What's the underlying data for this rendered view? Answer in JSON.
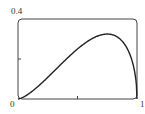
{
  "chart_data": {
    "type": "line",
    "title": "",
    "xlabel": "",
    "ylabel": "",
    "xlim": [
      0,
      1
    ],
    "ylim": [
      0,
      0.4
    ],
    "x_ticks": [
      0,
      0.5,
      1
    ],
    "y_ticks": [
      0,
      0.2,
      0.4
    ],
    "tick_labels": {
      "x_start": "0",
      "x_end": "1",
      "y_top": "0.4"
    },
    "grid": false,
    "legend": null,
    "series": [
      {
        "name": "curve",
        "x": [
          0,
          0.1,
          0.2,
          0.3,
          0.4,
          0.5,
          0.6,
          0.7,
          0.75,
          0.8,
          0.85,
          0.9,
          0.95,
          0.98,
          1.0
        ],
        "y": [
          0,
          0.03,
          0.08,
          0.137,
          0.196,
          0.25,
          0.294,
          0.32,
          0.325,
          0.32,
          0.303,
          0.27,
          0.207,
          0.137,
          0
        ]
      }
    ],
    "colors": {
      "line": "#222222",
      "frame": "#444444"
    }
  },
  "labels": {
    "y_top": "0.4",
    "origin": "0",
    "x_end": "1"
  }
}
